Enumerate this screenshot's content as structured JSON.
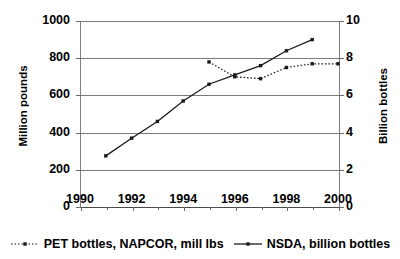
{
  "chart_data": {
    "type": "line",
    "title": "",
    "xlabel": "",
    "ylabel": "Million pounds",
    "ylabel_secondary": "Billion bottles",
    "x": [
      1990,
      1991,
      1992,
      1993,
      1994,
      1995,
      1996,
      1997,
      1998,
      1999,
      2000
    ],
    "xlim": [
      1990,
      2000
    ],
    "xticks": [
      1990,
      1992,
      1994,
      1996,
      1998,
      2000
    ],
    "xtick_labels": [
      "1990",
      "1992",
      "1994",
      "1996",
      "1998",
      "2000"
    ],
    "ylim": [
      0,
      1000
    ],
    "yticks": [
      0,
      200,
      400,
      600,
      800,
      1000
    ],
    "ytick_labels": [
      "0",
      "200",
      "400",
      "600",
      "800",
      "1000"
    ],
    "ylim_secondary": [
      0,
      10
    ],
    "yticks_secondary": [
      0,
      2,
      4,
      6,
      8,
      10
    ],
    "ytick_labels_secondary": [
      "0",
      "2",
      "4",
      "6",
      "8",
      "10"
    ],
    "grid": true,
    "legend_position": "bottom",
    "series": [
      {
        "name": "PET bottles, NAPCOR, mill lbs",
        "axis": "right",
        "style": "dotted",
        "marker": "square",
        "color": "#1a1a1a",
        "x": [
          1995,
          1996,
          1997,
          1998,
          1999,
          2000
        ],
        "values": [
          7.8,
          7.0,
          6.9,
          7.5,
          7.7,
          7.7
        ]
      },
      {
        "name": "NSDA, billion bottles",
        "axis": "left",
        "style": "solid",
        "marker": "square",
        "color": "#1a1a1a",
        "x": [
          1991,
          1992,
          1993,
          1994,
          1995,
          1996,
          1997,
          1998,
          1999
        ],
        "values": [
          275,
          370,
          460,
          570,
          660,
          710,
          760,
          840,
          900
        ]
      }
    ]
  },
  "axes": {
    "left_title": "Million pounds",
    "right_title": "Billion bottles",
    "left_ticks": [
      "1000",
      "800",
      "600",
      "400",
      "200",
      "0"
    ],
    "right_ticks": [
      "10",
      "8",
      "6",
      "4",
      "2",
      "0"
    ],
    "bottom_ticks": [
      "1990",
      "1992",
      "1994",
      "1996",
      "1998",
      "2000"
    ]
  },
  "legend": {
    "items": [
      {
        "label": "PET bottles, NAPCOR, mill lbs",
        "style": "dotted"
      },
      {
        "label": "NSDA, billion bottles",
        "style": "solid"
      }
    ]
  }
}
